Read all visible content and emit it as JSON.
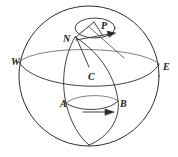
{
  "figure": {
    "kind": "sphere-rotation-diagram",
    "background_color": "#ffffff",
    "stroke_color": "#2b2b2b",
    "label_color": "#1a1a1a",
    "labels": [
      {
        "name": "label-N",
        "text": "N",
        "x": 63,
        "y": 34
      },
      {
        "name": "label-P",
        "text": "P",
        "x": 101,
        "y": 21
      },
      {
        "name": "label-C",
        "text": "C",
        "x": 88,
        "y": 72
      },
      {
        "name": "label-W",
        "text": "W",
        "x": 11,
        "y": 57
      },
      {
        "name": "label-E",
        "text": "E",
        "x": 163,
        "y": 62
      },
      {
        "name": "label-A",
        "text": "A",
        "x": 60,
        "y": 99
      },
      {
        "name": "label-B",
        "text": "B",
        "x": 120,
        "y": 99
      }
    ],
    "geometry": {
      "sphere": {
        "cx": 89,
        "cy": 76,
        "r": 70
      },
      "polar_circle": {
        "cx": 95,
        "cy": 28,
        "rx": 20,
        "ry": 10
      },
      "equator_label_left": "W",
      "equator_label_right": "E",
      "latitude_circle_points": [
        "A",
        "B"
      ],
      "center_point": "C",
      "pole_point": "N",
      "surface_point": "P"
    },
    "arrows": [
      {
        "name": "rotation-arrow-polar",
        "direction": "up-right"
      },
      {
        "name": "motion-arrow-equator",
        "direction": "right"
      }
    ]
  }
}
